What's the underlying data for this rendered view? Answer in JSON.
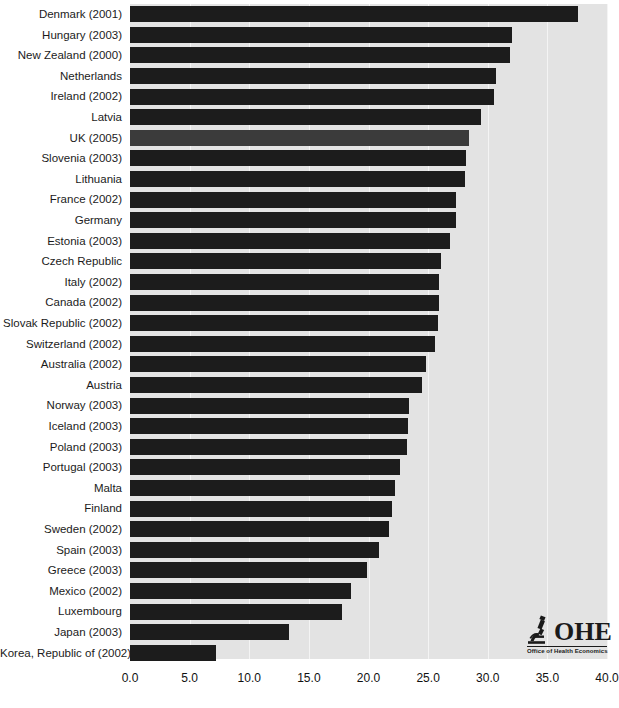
{
  "chart_data": {
    "type": "bar",
    "orientation": "horizontal",
    "title": "",
    "subtitle": "",
    "xlabel": "",
    "ylabel": "",
    "xlim": [
      0.0,
      40.0
    ],
    "xticks": [
      "0.0",
      "5.0",
      "10.0",
      "15.0",
      "20.0",
      "25.0",
      "30.0",
      "35.0",
      "40.0"
    ],
    "xtick_values": [
      0,
      5,
      10,
      15,
      20,
      25,
      30,
      35,
      40
    ],
    "grid": true,
    "grid_axis": "x",
    "legend": "none",
    "bar_color": "#1c1c1c",
    "highlight_color": "#3b3b3b",
    "highlight_category": "UK (2005)",
    "plot_background": "#e3e3e3",
    "gridline_color": "#f4f4f4",
    "categories": [
      "Denmark (2001)",
      "Hungary (2003)",
      "New Zealand (2000)",
      "Netherlands",
      "Ireland (2002)",
      "Latvia",
      "UK (2005)",
      "Slovenia (2003)",
      "Lithuania",
      "France (2002)",
      "Germany",
      "Estonia (2003)",
      "Czech Republic",
      "Italy (2002)",
      "Canada (2002)",
      "Slovak Republic (2002)",
      "Switzerland (2002)",
      "Australia (2002)",
      "Austria",
      "Norway (2003)",
      "Iceland (2003)",
      "Poland (2003)",
      "Portugal (2003)",
      "Malta",
      "Finland",
      "Sweden (2002)",
      "Spain (2003)",
      "Greece (2003)",
      "Mexico (2002)",
      "Luxembourg",
      "Japan (2003)",
      "Korea, Republic of (2002)"
    ],
    "values": [
      37.6,
      32.0,
      31.9,
      30.7,
      30.5,
      29.4,
      28.4,
      28.2,
      28.1,
      27.3,
      27.3,
      26.8,
      26.1,
      25.9,
      25.9,
      25.8,
      25.6,
      24.8,
      24.5,
      23.4,
      23.3,
      23.2,
      22.6,
      22.2,
      22.0,
      21.7,
      20.9,
      19.9,
      18.5,
      17.8,
      13.3,
      7.2
    ]
  },
  "logo": {
    "icon": "microscope-icon",
    "wordmark": "OHE",
    "tagline": "Office of Health Economics"
  }
}
